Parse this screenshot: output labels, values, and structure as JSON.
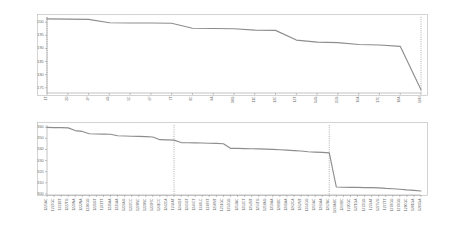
{
  "chart_data": [
    {
      "id": "top",
      "type": "line",
      "title": "",
      "xlabel": "",
      "ylabel": "",
      "ylim": [
        173,
        202
      ],
      "yticks": [
        175,
        180,
        185,
        190,
        195,
        200
      ],
      "grid": false,
      "legend": "none",
      "categories": [
        "1T",
        "2D",
        "3F",
        "4G",
        "5C",
        "6F",
        "7T",
        "8C",
        "9A",
        "10G",
        "11C",
        "12C",
        "13T",
        "14G",
        "15G",
        "16A",
        "17C",
        "18A",
        "19M"
      ],
      "values": [
        201.3,
        201.2,
        201.1,
        199.8,
        199.7,
        199.7,
        199.6,
        197.7,
        197.6,
        197.5,
        197.0,
        196.9,
        193.2,
        192.4,
        192.2,
        191.5,
        191.3,
        190.8,
        174.2
      ],
      "guides": [
        {
          "category": "1T",
          "style": "dotted"
        },
        {
          "category": "19M",
          "style": "dotted"
        }
      ]
    },
    {
      "id": "bottom",
      "type": "line",
      "title": "",
      "xlabel": "",
      "ylabel": "",
      "ylim": [
        299,
        362
      ],
      "yticks": [
        300,
        310,
        320,
        330,
        340,
        350,
        360
      ],
      "grid": false,
      "legend": "none",
      "categories": [
        "1225AC",
        "1227GC",
        "1231BT",
        "1227TG",
        "1239NA",
        "1222NA",
        "1230GG",
        "1231GT",
        "1231TT",
        "1231AA",
        "1235AA",
        "1236AG",
        "1237CC",
        "1238NC",
        "1239NC",
        "1239RC",
        "1241CC",
        "1242CA",
        "1244AT",
        "1244GT",
        "1245GT",
        "1246CT",
        "1248LC",
        "1248ST",
        "1250NT",
        "1251GC",
        "1252GG",
        "1253AC",
        "1253CT",
        "1254NT",
        "1255TG",
        "1258AG",
        "1259AA",
        "1289BC",
        "1261AA",
        "1262CA",
        "1262NT",
        "1264GG",
        "1265AC",
        "1266AA",
        "1267AC",
        "1269ABC",
        "1269BC",
        "1270GC",
        "1271GA",
        "1272GG",
        "1274AT",
        "1275VG",
        "1277TT",
        "1278GG",
        "1279GG",
        "1280GC",
        "1281GA",
        "1283GA"
      ],
      "values": [
        359.8,
        359.7,
        359.6,
        359.4,
        357.0,
        356.2,
        354.1,
        353.9,
        353.8,
        353.7,
        352.3,
        352.1,
        351.9,
        351.7,
        351.5,
        351.2,
        348.8,
        348.6,
        348.4,
        346.2,
        346.0,
        345.9,
        345.8,
        345.6,
        345.4,
        345.1,
        341.0,
        340.9,
        340.8,
        340.6,
        340.5,
        340.3,
        340.0,
        339.7,
        339.4,
        339.0,
        338.6,
        337.9,
        337.6,
        337.3,
        336.9,
        306.2,
        306.0,
        305.9,
        305.8,
        305.7,
        305.6,
        305.4,
        304.9,
        304.6,
        304.2,
        303.6,
        303.2,
        302.6
      ],
      "guides": [
        {
          "category": "1244AT",
          "style": "dotted"
        },
        {
          "category": "1267AC",
          "style": "dotted"
        }
      ]
    }
  ],
  "figure": {
    "corner_glyph": "·",
    "background_color": "#ffffff",
    "series_color": "#8d8d8d",
    "axis_color": "#9a9a9a",
    "guide_color": "#7a7a7a",
    "frame_color": "#b6b6b6",
    "tick_label_color": "#6d6d6d"
  }
}
